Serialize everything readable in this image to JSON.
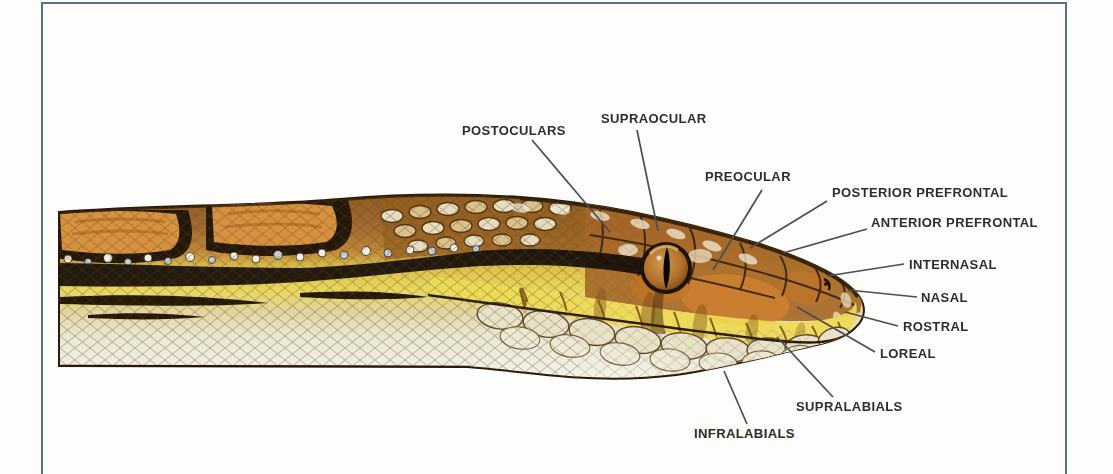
{
  "figure": {
    "type": "labeled-anatomical-diagram"
  },
  "frame": {
    "border_color": "#5d6f88"
  },
  "style": {
    "label_color": "#2d2d2d",
    "leader_line_color": "#4d4d4d",
    "dorsal_brown": "#a96e33",
    "blotch_orange": "#d8913e",
    "stripe_black": "#18100a",
    "band_yellow": "#ecd952",
    "belly_cream": "#f4f1e6",
    "eye_amber": "#b06c2e"
  },
  "labels": [
    {
      "id": "postoculars",
      "text": "POSTOCULARS"
    },
    {
      "id": "supraocular",
      "text": "SUPRAOCULAR"
    },
    {
      "id": "preocular",
      "text": "PREOCULAR"
    },
    {
      "id": "posterior-prefrontal",
      "text": "POSTERIOR PREFRONTAL"
    },
    {
      "id": "anterior-prefrontal",
      "text": "ANTERIOR PREFRONTAL"
    },
    {
      "id": "internasal",
      "text": "INTERNASAL"
    },
    {
      "id": "nasal",
      "text": "NASAL"
    },
    {
      "id": "rostral",
      "text": "ROSTRAL"
    },
    {
      "id": "loreal",
      "text": "LOREAL"
    },
    {
      "id": "supralabials",
      "text": "SUPRALABIALS"
    },
    {
      "id": "infralabials",
      "text": "INFRALABIALS"
    }
  ]
}
